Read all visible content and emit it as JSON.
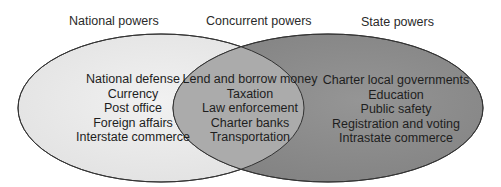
{
  "diagram": {
    "type": "venn",
    "colors": {
      "national_fill": "#ececec",
      "state_fill": "#8c8c8c",
      "overlap_fill": "#a9a9a9",
      "stroke": "#333333",
      "text": "#1e1e1e"
    },
    "sets": {
      "national": {
        "title": "National powers",
        "items": [
          "National defense",
          "Currency",
          "Post office",
          "Foreign affairs",
          "Interstate commerce"
        ]
      },
      "concurrent": {
        "title": "Concurrent powers",
        "items": [
          "Lend and borrow money",
          "Taxation",
          "Law enforcement",
          "Charter banks",
          "Transportation"
        ]
      },
      "state": {
        "title": "State powers",
        "items": [
          "Charter local governments",
          "Education",
          "Public safety",
          "Registration and voting",
          "Intrastate commerce"
        ]
      }
    }
  }
}
